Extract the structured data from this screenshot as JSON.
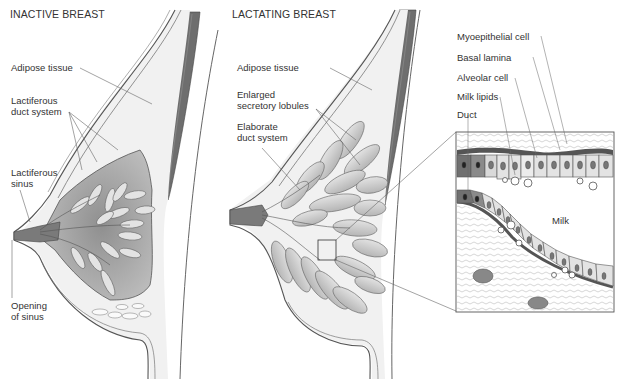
{
  "panels": {
    "inactive": {
      "title": "INACTIVE BREAST",
      "labels": {
        "adipose": "Adipose tissue",
        "duct_system": "Lactiferous\nduct system",
        "sinus": "Lactiferous\nsinus",
        "opening": "Opening\nof sinus"
      }
    },
    "lactating": {
      "title": "LACTATING BREAST",
      "labels": {
        "adipose": "Adipose tissue",
        "lobules": "Enlarged\nsecretory lobules",
        "ducts": "Elaborate\nduct system"
      }
    },
    "inset": {
      "labels": {
        "myoepithelial": "Myoepithelial cell",
        "basal_lamina": "Basal lamina",
        "alveolar": "Alveolar cell",
        "lipids": "Milk lipids",
        "duct": "Duct",
        "milk": "Milk"
      }
    }
  },
  "colors": {
    "skin_line": "#555555",
    "muscle": "#6e6e6e",
    "gland_fill": "#a8a8a8",
    "lobule_fill": "#cfcfcf",
    "fat_fill": "#ececec",
    "dark_cell": "#707070",
    "light_cell": "#d9d9d9"
  }
}
